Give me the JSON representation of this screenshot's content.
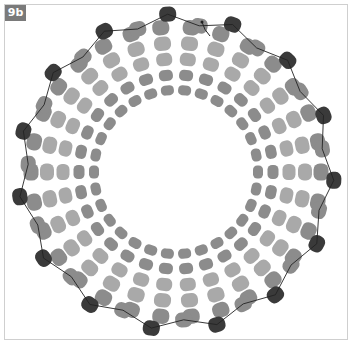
{
  "figure": {
    "label": "9b"
  },
  "colors": {
    "frame": "#cfcfcf",
    "label_bg": "#7a7a7a",
    "label_text": "#ffffff",
    "bead_light": "#a9a9a9",
    "bead_mid": "#8c8c8c",
    "bead_dark": "#3a3a3a",
    "thread": "#222222"
  },
  "ring": {
    "cx": 176,
    "cy": 172,
    "rows": [
      {
        "radius": 82,
        "count": 30,
        "color": "bead_mid",
        "w": 10,
        "h": 13,
        "offset": 0
      },
      {
        "radius": 97,
        "count": 30,
        "color": "bead_mid",
        "w": 11,
        "h": 14,
        "offset": 6
      },
      {
        "radius": 113,
        "count": 30,
        "color": "bead_light",
        "w": 13,
        "h": 16,
        "offset": 0
      },
      {
        "radius": 129,
        "count": 30,
        "color": "bead_light",
        "w": 14,
        "h": 17,
        "offset": 6
      },
      {
        "radius": 145,
        "count": 30,
        "color": "bead_mid",
        "w": 15,
        "h": 17,
        "offset": 0
      }
    ],
    "edge": {
      "radius_peak": 158,
      "radius_valley": 148,
      "count": 15,
      "accent_every": 1,
      "w": 15,
      "h": 17
    }
  }
}
